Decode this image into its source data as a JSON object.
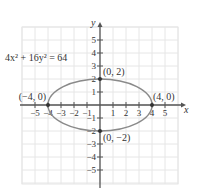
{
  "chart_data": {
    "type": "line",
    "title": "",
    "equation": "4x² + 16y² = 64",
    "xlabel": "x",
    "ylabel": "y",
    "xlim": [
      -5.8,
      5.8
    ],
    "ylim": [
      -6,
      6
    ],
    "grid": true,
    "x_ticks": [
      -5,
      -4,
      -3,
      -2,
      -1,
      1,
      2,
      3,
      4,
      5
    ],
    "y_ticks": [
      -5,
      -4,
      -3,
      -2,
      -1,
      1,
      2,
      3,
      4,
      5
    ],
    "series": [
      {
        "name": "ellipse",
        "kind": "ellipse",
        "center": [
          0,
          0
        ],
        "semi_major_x": 4,
        "semi_minor_y": 2,
        "color": "#8a8a8a"
      }
    ],
    "points": [
      {
        "x": 0,
        "y": 2,
        "label": "(0, 2)"
      },
      {
        "x": 0,
        "y": -2,
        "label": "(0, −2)"
      },
      {
        "x": -4,
        "y": 0,
        "label": "(−4, 0)"
      },
      {
        "x": 4,
        "y": 0,
        "label": "(4, 0)"
      }
    ]
  },
  "colors": {
    "grid": "#e6e6e6",
    "axis": "#555555",
    "ellipse": "#8a8a8a",
    "point": "#333333"
  }
}
